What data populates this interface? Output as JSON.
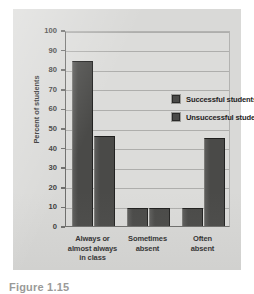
{
  "figure": {
    "caption": "Figure 1.15",
    "panel_color": "#d9d9d7",
    "plot_background": "#dcdcda",
    "bar_color": "#4a4a48",
    "axis_color": "#6e6e6c",
    "grid_color": "#aeaeac"
  },
  "chart_data": {
    "type": "bar",
    "title": "",
    "xlabel": "",
    "ylabel": "Percent of students",
    "ylim": [
      0,
      100
    ],
    "yticks": [
      0,
      10,
      20,
      30,
      40,
      50,
      60,
      70,
      80,
      90,
      100
    ],
    "grid": true,
    "legend_position": "inside-upper-right",
    "categories": [
      "Always or almost always in class",
      "Sometimes absent",
      "Often absent"
    ],
    "category_lines": [
      [
        "Always or",
        "almost always",
        "in class"
      ],
      [
        "Sometimes",
        "absent"
      ],
      [
        "Often",
        "absent"
      ]
    ],
    "series": [
      {
        "name": "Successful students",
        "values": [
          84,
          9,
          9
        ]
      },
      {
        "name": "Unsuccessful students",
        "values": [
          46,
          9,
          45
        ]
      }
    ]
  }
}
